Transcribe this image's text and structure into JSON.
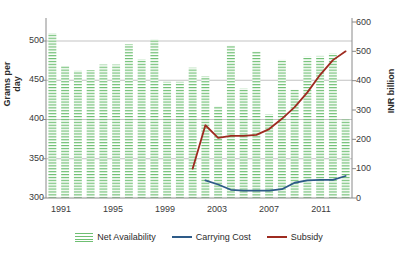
{
  "chart_data": {
    "type": "bar",
    "title": "",
    "xlabel": "",
    "ylabel": "Grams per day",
    "y2label": "INR billion",
    "grid": true,
    "legend_position": "bottom",
    "ylim": [
      300,
      520
    ],
    "y2lim": [
      0,
      600
    ],
    "yticks": [
      300,
      350,
      400,
      450,
      500
    ],
    "y2ticks": [
      0,
      100,
      200,
      300,
      400,
      500,
      600
    ],
    "xticks": [
      1991,
      1995,
      1999,
      2003,
      2007,
      2011
    ],
    "categories": [
      1991,
      1992,
      1993,
      1994,
      1995,
      1996,
      1997,
      1998,
      1999,
      2000,
      2001,
      2002,
      2003,
      2004,
      2005,
      2006,
      2007,
      2008,
      2009,
      2010,
      2011,
      2012,
      2013,
      2014
    ],
    "series": [
      {
        "name": "Net Availability",
        "axis": "left",
        "type": "bar",
        "color": "#6fbf73",
        "values": [
          510,
          468,
          462,
          463,
          470,
          470,
          496,
          477,
          502,
          448,
          448,
          466,
          455,
          417,
          494,
          440,
          487,
          407,
          476,
          438,
          480,
          481,
          484,
          400
        ]
      },
      {
        "name": "Carrying Cost",
        "axis": "right",
        "type": "line",
        "color": "#2e5b88",
        "values": [
          null,
          null,
          null,
          null,
          null,
          null,
          null,
          null,
          null,
          null,
          null,
          null,
          60,
          46,
          28,
          25,
          25,
          25,
          30,
          52,
          60,
          62,
          62,
          75
        ]
      },
      {
        "name": "Subsidy",
        "axis": "right",
        "type": "line",
        "color": "#9e2b20",
        "values": [
          null,
          null,
          null,
          null,
          null,
          null,
          null,
          null,
          null,
          null,
          null,
          100,
          248,
          205,
          212,
          212,
          215,
          235,
          270,
          310,
          360,
          420,
          470,
          500
        ]
      }
    ]
  },
  "axes": {
    "left_title": "Grams per day",
    "right_title": "INR billion",
    "left_ticks": [
      "500",
      "450",
      "400",
      "350",
      "300"
    ],
    "right_ticks": [
      "600",
      "500",
      "400",
      "300",
      "200",
      "100",
      "0"
    ],
    "x_ticks": [
      "1991",
      "1995",
      "1999",
      "2003",
      "2007",
      "2011"
    ]
  },
  "legend": {
    "items": [
      {
        "label": "Net Availability",
        "marker": "hatched-swatch",
        "color": "#6fbf73"
      },
      {
        "label": "Carrying Cost",
        "marker": "line-swatch",
        "color": "#2e5b88"
      },
      {
        "label": "Subsidy",
        "marker": "line-swatch",
        "color": "#9e2b20"
      }
    ]
  },
  "colors": {
    "bar": "#6fbf73",
    "carrying_cost": "#2e5b88",
    "subsidy": "#9e2b20",
    "grid": "#b4b4b4",
    "axis": "#8a8a8a"
  }
}
